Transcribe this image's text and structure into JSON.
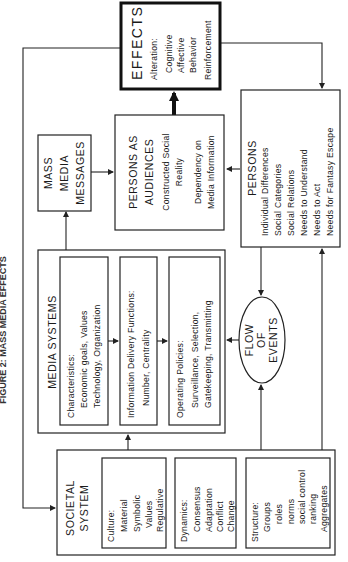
{
  "title": "FIGURE 2: MASS MEDIA EFFECTS",
  "effects": {
    "heading": "EFFECTS",
    "subheading": "Alteration:",
    "items": [
      "Cognitive",
      "Affective",
      "Behavior"
    ],
    "footer": "Reinforcement"
  },
  "mass_media_messages": {
    "lines": [
      "MASS",
      "MEDIA",
      "MESSAGES"
    ]
  },
  "persons_as_audiences": {
    "lines": [
      "PERSONS AS",
      "AUDIENCES"
    ],
    "items": [
      "Constructed Social",
      "Reality",
      "Dependency on",
      "Media Information"
    ]
  },
  "persons": {
    "heading": "PERSONS",
    "items": [
      "Individual Differences",
      "Social Categories",
      "Social Relations",
      "Needs to Understand",
      "Needs to Act",
      "Needs for Fantasy Escape"
    ]
  },
  "media_systems": {
    "heading": "MEDIA SYSTEMS",
    "characteristics": {
      "label": "Characteristics:",
      "lines": [
        "Economic goals, Values",
        "Technology, Organization"
      ]
    },
    "information_delivery": {
      "label": "Information Delivery Functions:",
      "lines": [
        "Number, Centrality"
      ]
    },
    "operating_policies": {
      "label": "Operating Policies:",
      "lines": [
        "Surveillance, Selection,",
        "Gatekeeping, Transmitting"
      ]
    }
  },
  "flow_of_events": {
    "lines": [
      "FLOW",
      "OF",
      "EVENTS"
    ]
  },
  "societal_system": {
    "lines": [
      "SOCIETAL",
      "SYSTEM"
    ],
    "culture": {
      "label": "Culture:",
      "items": [
        "Material",
        "Symbolic",
        "Values",
        "Regulative"
      ]
    },
    "dynamics": {
      "label": "Dynamics:",
      "items": [
        "Consensus",
        "Adaptation",
        "Conflict",
        "Change"
      ]
    },
    "structure": {
      "label": "Structure:",
      "items": [
        "Groups",
        "roles",
        "norms",
        "social control",
        "ranking",
        "Aggregates"
      ]
    }
  }
}
